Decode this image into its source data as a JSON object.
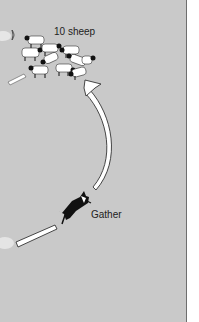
{
  "diagram": {
    "sheep_label": "10 sheep",
    "dog_label": "Gather",
    "sheep_count": 10,
    "colors": {
      "background": "#c9c9c9",
      "arrow_fill": "#ffffff",
      "outline": "#333333",
      "dog": "#111111"
    },
    "icons": {
      "sheep": "sheep-icon",
      "dog": "sheepdog-icon",
      "arrow": "curved-arrow-icon"
    }
  }
}
